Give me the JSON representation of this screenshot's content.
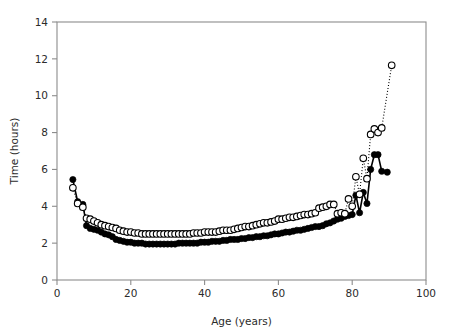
{
  "chart_data": {
    "type": "line",
    "title": "",
    "subtitle": "",
    "xlabel": "Age (years)",
    "ylabel": "Time (hours)",
    "xlim": [
      0,
      100
    ],
    "ylim": [
      0,
      14
    ],
    "xticks": [
      0,
      20,
      40,
      60,
      80,
      100
    ],
    "yticks": [
      0,
      2,
      4,
      6,
      8,
      10,
      12,
      14
    ],
    "grid": false,
    "legend": "none",
    "annotations": [],
    "axis_box": [
      "left",
      "bottom",
      "top",
      "right"
    ],
    "series": [
      {
        "name": "filled-circles",
        "marker": "filled-circle",
        "marker_color": "#000000",
        "line_style": "solid",
        "line_color": "#000000",
        "x": [
          4.3,
          5.6,
          7.0,
          8.0,
          9.0,
          10.0,
          11.0,
          12.0,
          13.0,
          14.0,
          15.0,
          16.0,
          17.0,
          18.0,
          19.0,
          20.0,
          21.0,
          22.0,
          23.0,
          24.0,
          25.0,
          26.0,
          27.0,
          28.0,
          29.0,
          30.0,
          31.0,
          32.0,
          33.0,
          34.0,
          35.0,
          36.0,
          37.0,
          38.0,
          39.0,
          40.0,
          41.0,
          42.0,
          43.0,
          44.0,
          45.0,
          46.0,
          47.0,
          48.0,
          49.0,
          50.0,
          51.0,
          52.0,
          53.0,
          54.0,
          55.0,
          56.0,
          57.0,
          58.0,
          59.0,
          60.0,
          61.0,
          62.0,
          63.0,
          64.0,
          65.0,
          66.0,
          67.0,
          68.0,
          69.0,
          70.0,
          71.0,
          72.0,
          73.0,
          74.0,
          75.0,
          76.0,
          77.0,
          78.0,
          79.0,
          80.0,
          81.0,
          82.0,
          83.0,
          84.0,
          85.0,
          86.0,
          87.0,
          88.0,
          89.5
        ],
        "y": [
          5.45,
          4.25,
          4.1,
          2.95,
          2.8,
          2.75,
          2.7,
          2.6,
          2.5,
          2.45,
          2.35,
          2.2,
          2.15,
          2.1,
          2.05,
          2.05,
          2.0,
          2.0,
          2.0,
          1.95,
          1.95,
          1.95,
          1.95,
          1.95,
          1.95,
          1.95,
          1.95,
          1.95,
          2.0,
          2.0,
          2.0,
          2.0,
          2.0,
          2.0,
          2.05,
          2.05,
          2.05,
          2.1,
          2.1,
          2.1,
          2.15,
          2.15,
          2.2,
          2.2,
          2.2,
          2.25,
          2.25,
          2.3,
          2.3,
          2.35,
          2.35,
          2.4,
          2.4,
          2.45,
          2.5,
          2.5,
          2.55,
          2.6,
          2.6,
          2.65,
          2.7,
          2.7,
          2.75,
          2.8,
          2.85,
          2.9,
          2.9,
          2.95,
          3.05,
          3.1,
          3.2,
          3.3,
          3.35,
          3.45,
          3.5,
          3.55,
          4.6,
          3.65,
          4.75,
          4.15,
          6.0,
          6.8,
          6.8,
          5.9,
          5.85
        ]
      },
      {
        "name": "open-circles",
        "marker": "open-circle",
        "marker_color": "#ffffff",
        "marker_edge_color": "#000000",
        "line_style": "dotted",
        "line_color": "#000000",
        "x": [
          4.3,
          5.6,
          7.0,
          8.0,
          9.0,
          10.0,
          11.0,
          12.0,
          13.0,
          14.0,
          15.0,
          16.0,
          17.0,
          18.0,
          19.0,
          20.0,
          21.0,
          22.0,
          23.0,
          24.0,
          25.0,
          26.0,
          27.0,
          28.0,
          29.0,
          30.0,
          31.0,
          32.0,
          33.0,
          34.0,
          35.0,
          36.0,
          37.0,
          38.0,
          39.0,
          40.0,
          41.0,
          42.0,
          43.0,
          44.0,
          45.0,
          46.0,
          47.0,
          48.0,
          49.0,
          50.0,
          51.0,
          52.0,
          53.0,
          54.0,
          55.0,
          56.0,
          57.0,
          58.0,
          59.0,
          60.0,
          61.0,
          62.0,
          63.0,
          64.0,
          65.0,
          66.0,
          67.0,
          68.0,
          69.0,
          70.0,
          71.0,
          72.0,
          73.0,
          74.0,
          75.0,
          76.0,
          77.0,
          78.0,
          79.0,
          80.0,
          81.0,
          82.0,
          83.0,
          84.0,
          85.0,
          86.0,
          87.0,
          88.0,
          90.7
        ],
        "y": [
          5.0,
          4.15,
          3.95,
          3.35,
          3.3,
          3.2,
          3.1,
          3.0,
          2.95,
          2.9,
          2.85,
          2.8,
          2.7,
          2.65,
          2.6,
          2.6,
          2.55,
          2.55,
          2.5,
          2.5,
          2.5,
          2.5,
          2.5,
          2.5,
          2.5,
          2.5,
          2.5,
          2.5,
          2.5,
          2.5,
          2.5,
          2.5,
          2.55,
          2.55,
          2.55,
          2.6,
          2.6,
          2.6,
          2.6,
          2.65,
          2.7,
          2.7,
          2.7,
          2.75,
          2.8,
          2.85,
          2.9,
          2.9,
          2.95,
          3.0,
          3.05,
          3.1,
          3.1,
          3.15,
          3.2,
          3.3,
          3.3,
          3.35,
          3.4,
          3.4,
          3.45,
          3.5,
          3.55,
          3.55,
          3.6,
          3.65,
          3.9,
          3.95,
          4.0,
          4.1,
          4.1,
          3.6,
          3.65,
          3.6,
          4.4,
          4.0,
          5.6,
          4.65,
          6.6,
          5.5,
          7.9,
          8.2,
          8.0,
          8.25,
          11.65
        ]
      }
    ]
  }
}
